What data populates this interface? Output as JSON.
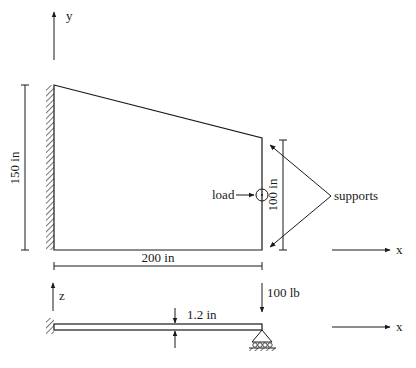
{
  "colors": {
    "ink": "#1a1a1a",
    "background": "#ffffff"
  },
  "top_view": {
    "axis_y_label": "y",
    "axis_x_label": "x",
    "height_dim": "150 in",
    "width_dim": "200 in",
    "right_edge_dim": "100 in",
    "load_label": "load",
    "supports_label": "supports"
  },
  "side_view": {
    "axis_z_label": "z",
    "axis_x_label": "x",
    "force_label": "100 lb",
    "thickness_dim": "1.2 in"
  }
}
